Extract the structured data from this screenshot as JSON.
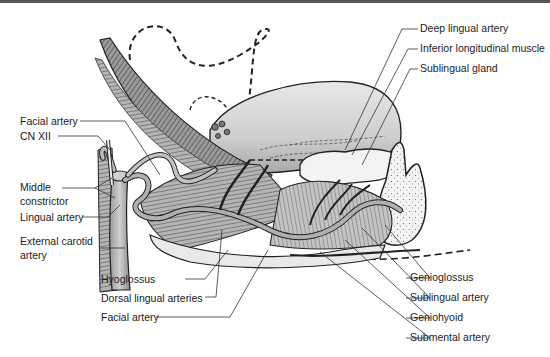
{
  "figure": {
    "colors": {
      "muscle_dark": "#5a5a5a",
      "muscle_mid": "#8c8c8c",
      "tongue_fill": "#cfcfcf",
      "tongue_light": "#e6e6e6",
      "artery_fill": "#a8a8a8",
      "gland_fill": "#f2f2f2",
      "bone_fill": "#f4f4f4",
      "line": "#333333",
      "text": "#222222"
    }
  },
  "labels": {
    "left": [
      {
        "id": "facial-artery-upper",
        "text": "Facial artery"
      },
      {
        "id": "cn-xii",
        "text": "CN XII"
      },
      {
        "id": "middle-constrictor",
        "text": "Middle constrictor",
        "line1": "Middle",
        "line2": "constrictor"
      },
      {
        "id": "lingual-artery",
        "text": "Lingual artery"
      },
      {
        "id": "external-carotid-artery",
        "text": "External carotid artery",
        "line1": "External carotid",
        "line2": "artery"
      }
    ],
    "bottom": [
      {
        "id": "hyoglossus",
        "text": "Hyoglossus"
      },
      {
        "id": "dorsal-lingual-arteries",
        "text": "Dorsal lingual arteries"
      },
      {
        "id": "facial-artery-lower",
        "text": "Facial artery"
      }
    ],
    "right_top": [
      {
        "id": "deep-lingual-artery",
        "text": "Deep lingual artery"
      },
      {
        "id": "inferior-longitudinal-muscle",
        "text": "Inferior longitudinal muscle"
      },
      {
        "id": "sublingual-gland",
        "text": "Sublingual gland"
      }
    ],
    "right_bottom": [
      {
        "id": "genioglossus",
        "text": "Genioglossus"
      },
      {
        "id": "sublingual-artery",
        "text": "Sublingual artery"
      },
      {
        "id": "geniohyoid",
        "text": "Geniohyoid"
      },
      {
        "id": "submental-artery",
        "text": "Submental artery"
      }
    ]
  }
}
